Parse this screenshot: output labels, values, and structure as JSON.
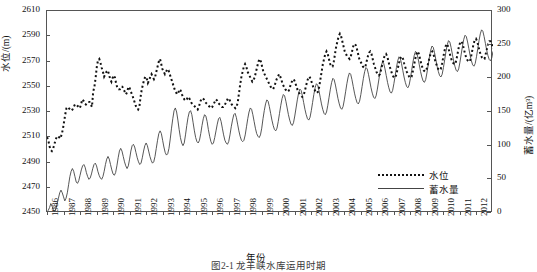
{
  "figure": {
    "caption": "图2-1  龙羊峡水库运用时期"
  },
  "chart_data": {
    "type": "line",
    "title": "",
    "xlabel": "年份",
    "ylabel": "水位/(m)",
    "y2label": "蓄水量/(亿m³)",
    "grid": false,
    "legend_position": "bottom-right",
    "ylim": [
      2450,
      2610
    ],
    "yticks": [
      2450,
      2470,
      2490,
      2510,
      2530,
      2550,
      2570,
      2590,
      2610
    ],
    "y2lim": [
      0,
      300
    ],
    "y2ticks": [
      0,
      50,
      100,
      150,
      200,
      250,
      300
    ],
    "xlim": [
      1986,
      2012.92
    ],
    "xticks": [
      1986,
      1987,
      1988,
      1989,
      1990,
      1991,
      1992,
      1993,
      1994,
      1995,
      1996,
      1997,
      1998,
      1999,
      2000,
      2001,
      2002,
      2003,
      2004,
      2005,
      2006,
      2007,
      2008,
      2009,
      2010,
      2011,
      2012
    ],
    "xticklabels": [
      "1986",
      "1987",
      "1988",
      "1989",
      "1990",
      "1991",
      "1992",
      "1993",
      "1994",
      "1995",
      "1996",
      "1997",
      "1998",
      "1999",
      "2000",
      "2001",
      "2002",
      "2003",
      "2004",
      "2005",
      "2006",
      "2007",
      "2008",
      "2009",
      "2010",
      "2011",
      "2012"
    ],
    "series": [
      {
        "name": "水位",
        "axis": "left",
        "style": "dotted",
        "color": "#111111",
        "unit": "m",
        "values": [
          2510,
          2508,
          2503,
          2500,
          2499,
          2501,
          2504,
          2508,
          2510,
          2511,
          2510,
          2509,
          2512,
          2516,
          2522,
          2528,
          2533,
          2534,
          2533,
          2532,
          2531,
          2532,
          2534,
          2536,
          2536,
          2535,
          2534,
          2533,
          2536,
          2540,
          2539,
          2537,
          2536,
          2537,
          2538,
          2538,
          2536,
          2534,
          2546,
          2550,
          2557,
          2566,
          2571,
          2572,
          2569,
          2565,
          2562,
          2558,
          2560,
          2562,
          2563,
          2560,
          2556,
          2554,
          2557,
          2559,
          2557,
          2552,
          2549,
          2548,
          2548,
          2550,
          2550,
          2548,
          2546,
          2544,
          2546,
          2550,
          2549,
          2546,
          2544,
          2541,
          2538,
          2535,
          2533,
          2532,
          2534,
          2542,
          2548,
          2552,
          2556,
          2558,
          2557,
          2553,
          2555,
          2558,
          2560,
          2558,
          2556,
          2558,
          2562,
          2566,
          2570,
          2572,
          2568,
          2564,
          2562,
          2560,
          2562,
          2564,
          2563,
          2560,
          2557,
          2554,
          2551,
          2548,
          2546,
          2544,
          2545,
          2548,
          2547,
          2544,
          2542,
          2540,
          2539,
          2540,
          2542,
          2541,
          2539,
          2537,
          2536,
          2535,
          2534,
          2533,
          2532,
          2534,
          2538,
          2540,
          2541,
          2540,
          2538,
          2537,
          2536,
          2535,
          2534,
          2533,
          2534,
          2536,
          2538,
          2540,
          2539,
          2537,
          2536,
          2535,
          2534,
          2534,
          2535,
          2537,
          2539,
          2541,
          2540,
          2538,
          2536,
          2535,
          2534,
          2533,
          2534,
          2538,
          2545,
          2552,
          2558,
          2562,
          2566,
          2568,
          2566,
          2562,
          2560,
          2558,
          2556,
          2554,
          2555,
          2558,
          2562,
          2566,
          2570,
          2572,
          2570,
          2566,
          2562,
          2560,
          2558,
          2556,
          2554,
          2552,
          2550,
          2549,
          2548,
          2550,
          2553,
          2556,
          2558,
          2560,
          2558,
          2555,
          2552,
          2550,
          2548,
          2547,
          2546,
          2547,
          2550,
          2553,
          2555,
          2556,
          2554,
          2551,
          2548,
          2546,
          2544,
          2543,
          2542,
          2543,
          2546,
          2550,
          2554,
          2557,
          2558,
          2556,
          2553,
          2550,
          2548,
          2546,
          2545,
          2546,
          2550,
          2556,
          2562,
          2568,
          2572,
          2576,
          2578,
          2576,
          2572,
          2568,
          2566,
          2566,
          2570,
          2576,
          2582,
          2586,
          2590,
          2592,
          2590,
          2586,
          2582,
          2578,
          2576,
          2574,
          2573,
          2572,
          2574,
          2578,
          2582,
          2584,
          2583,
          2580,
          2576,
          2572,
          2570,
          2568,
          2566,
          2565,
          2566,
          2570,
          2574,
          2577,
          2578,
          2576,
          2572,
          2568,
          2565,
          2562,
          2560,
          2559,
          2560,
          2564,
          2568,
          2572,
          2575,
          2576,
          2574,
          2570,
          2566,
          2563,
          2560,
          2558,
          2557,
          2558,
          2562,
          2566,
          2570,
          2573,
          2574,
          2572,
          2568,
          2565,
          2562,
          2560,
          2558,
          2557,
          2558,
          2562,
          2567,
          2572,
          2576,
          2578,
          2576,
          2572,
          2568,
          2565,
          2563,
          2562,
          2563,
          2566,
          2570,
          2574,
          2577,
          2578,
          2576,
          2572,
          2569,
          2566,
          2564,
          2563,
          2564,
          2568,
          2573,
          2578,
          2582,
          2584,
          2582,
          2578,
          2574,
          2571,
          2569,
          2568,
          2568,
          2572,
          2577,
          2582,
          2585,
          2586,
          2584,
          2580,
          2576,
          2573,
          2571,
          2570,
          2570,
          2574,
          2579,
          2584,
          2587,
          2588,
          2586,
          2582,
          2578,
          2575,
          2573,
          2572,
          2572,
          2576,
          2580,
          2584,
          2586,
          2586,
          2584,
          2580
        ]
      },
      {
        "name": "蓄水量",
        "axis": "right",
        "style": "solid",
        "color": "#444444",
        "unit": "亿m³",
        "values": [
          2,
          4,
          8,
          14,
          10,
          5,
          2,
          6,
          14,
          22,
          30,
          34,
          30,
          24,
          18,
          22,
          30,
          42,
          54,
          62,
          66,
          62,
          54,
          46,
          44,
          48,
          56,
          64,
          70,
          72,
          68,
          60,
          54,
          50,
          52,
          58,
          66,
          72,
          74,
          70,
          62,
          56,
          52,
          50,
          54,
          62,
          72,
          80,
          84,
          80,
          72,
          64,
          58,
          56,
          60,
          70,
          82,
          92,
          96,
          92,
          84,
          76,
          70,
          66,
          70,
          80,
          92,
          100,
          102,
          98,
          90,
          82,
          76,
          72,
          74,
          82,
          92,
          100,
          104,
          100,
          92,
          84,
          78,
          74,
          76,
          84,
          96,
          108,
          118,
          122,
          118,
          108,
          98,
          90,
          86,
          88,
          96,
          110,
          126,
          140,
          152,
          156,
          150,
          138,
          124,
          112,
          104,
          100,
          104,
          116,
          130,
          142,
          150,
          152,
          146,
          134,
          122,
          112,
          106,
          104,
          108,
          118,
          130,
          140,
          146,
          144,
          136,
          124,
          114,
          106,
          102,
          104,
          112,
          122,
          132,
          140,
          142,
          136,
          126,
          116,
          108,
          104,
          102,
          106,
          116,
          128,
          138,
          146,
          148,
          142,
          132,
          122,
          114,
          108,
          106,
          108,
          116,
          128,
          140,
          150,
          156,
          154,
          146,
          136,
          126,
          118,
          114,
          112,
          116,
          126,
          140,
          152,
          162,
          168,
          166,
          158,
          148,
          138,
          130,
          124,
          122,
          126,
          136,
          148,
          160,
          170,
          176,
          174,
          166,
          156,
          146,
          138,
          132,
          130,
          134,
          144,
          156,
          168,
          178,
          184,
          182,
          174,
          164,
          154,
          146,
          140,
          138,
          142,
          152,
          164,
          176,
          186,
          192,
          190,
          182,
          172,
          162,
          154,
          148,
          146,
          150,
          160,
          172,
          184,
          194,
          200,
          198,
          190,
          180,
          170,
          162,
          156,
          154,
          158,
          168,
          180,
          192,
          202,
          208,
          206,
          198,
          188,
          178,
          170,
          164,
          162,
          166,
          176,
          188,
          200,
          210,
          216,
          214,
          206,
          196,
          186,
          178,
          172,
          170,
          174,
          184,
          196,
          208,
          218,
          224,
          222,
          214,
          204,
          194,
          186,
          180,
          178,
          182,
          192,
          204,
          216,
          226,
          232,
          230,
          222,
          212,
          202,
          194,
          188,
          186,
          190,
          200,
          212,
          224,
          234,
          240,
          238,
          230,
          220,
          210,
          202,
          196,
          194,
          198,
          208,
          220,
          232,
          242,
          248,
          246,
          238,
          228,
          218,
          210,
          204,
          202,
          206,
          216,
          228,
          240,
          250,
          256,
          254,
          246,
          236,
          226,
          218,
          212,
          210,
          214,
          224,
          236,
          248,
          258,
          264,
          262,
          254,
          244,
          234,
          226,
          220,
          218,
          222,
          232,
          244,
          256,
          266,
          272,
          270,
          262,
          252,
          242,
          234,
          228,
          226,
          230,
          240
        ]
      }
    ]
  },
  "axes": {
    "left_ticks": [
      "2450",
      "2470",
      "2490",
      "2510",
      "2530",
      "2550",
      "2570",
      "2590",
      "2610"
    ],
    "right_ticks": [
      "0",
      "50",
      "100",
      "150",
      "200",
      "250",
      "300"
    ],
    "x_ticks": [
      "1986",
      "1987",
      "1988",
      "1989",
      "1990",
      "1991",
      "1992",
      "1993",
      "1994",
      "1995",
      "1996",
      "1997",
      "1998",
      "1999",
      "2000",
      "2001",
      "2002",
      "2003",
      "2004",
      "2005",
      "2006",
      "2007",
      "2008",
      "2009",
      "2010",
      "2011",
      "2012"
    ],
    "left_title": "水位/(m)",
    "right_title": "蓄水量/(亿m³)",
    "x_title": "年份"
  },
  "legend": {
    "items": [
      {
        "label": "水位",
        "style": "dotted"
      },
      {
        "label": "蓄水量",
        "style": "solid"
      }
    ]
  },
  "colors": {
    "water_level": "#111111",
    "storage": "#444444",
    "frame": "#555555"
  }
}
